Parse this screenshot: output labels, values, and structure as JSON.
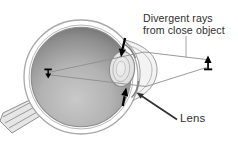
{
  "diagram": {
    "type": "eye-accommodation-cross-section",
    "labels": {
      "divergent_rays_line1": "Divergent rays",
      "divergent_rays_line2": "from close object",
      "lens": "Lens"
    },
    "colors": {
      "background": "#ffffff",
      "text": "#2e2e2e",
      "eye_outline": "#a8a8a8",
      "inner_ring": "#b8b8b8",
      "interior_edge": "#6c6c6c",
      "interior_light": "#c9c9c9",
      "ray": "#8f8f8f",
      "leader_thin": "#9a9a9a",
      "leader_lens": "#2f2f2f",
      "arrow_black": "#111111",
      "lens_fill": "#e9e9e9",
      "cornea_fill": "#f3f3f3",
      "optic_nerve_fill": "#e6e6e6"
    }
  }
}
